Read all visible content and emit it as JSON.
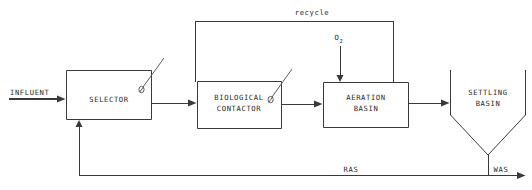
{
  "diagram": {
    "stroke_color": "#3a3a3a",
    "text_color": "#2b2b2b",
    "background_color": "#ffffff",
    "vessels": [
      {
        "id": "selector",
        "name": "selector",
        "shape": "rectangle",
        "label_line1": "SELECTOR",
        "label_line2": "",
        "has_mixer": true
      },
      {
        "id": "biological-contactor",
        "name": "biological-contactor",
        "shape": "rectangle",
        "label_line1": "BIOLOGICAL",
        "label_line2": "CONTACTOR",
        "has_mixer": true
      },
      {
        "id": "aeration-basin",
        "name": "aeration-basin",
        "shape": "rectangle",
        "label_line1": "AERATION",
        "label_line2": "BASIN",
        "has_mixer": false
      },
      {
        "id": "settling-basin",
        "name": "settling-basin",
        "shape": "hopper",
        "label_line1": "SETTLING",
        "label_line2": "BASIN",
        "has_mixer": false
      }
    ],
    "streams": [
      {
        "id": "influent",
        "label": "INFLUENT",
        "underlined": true
      },
      {
        "id": "recycle",
        "label": "recycle",
        "underlined": false
      },
      {
        "id": "oxygen",
        "label": "O",
        "subscript": "2",
        "underlined": false
      },
      {
        "id": "ras",
        "label": "RAS",
        "underlined": false
      },
      {
        "id": "was",
        "label": "WAS",
        "underlined": false
      }
    ]
  }
}
